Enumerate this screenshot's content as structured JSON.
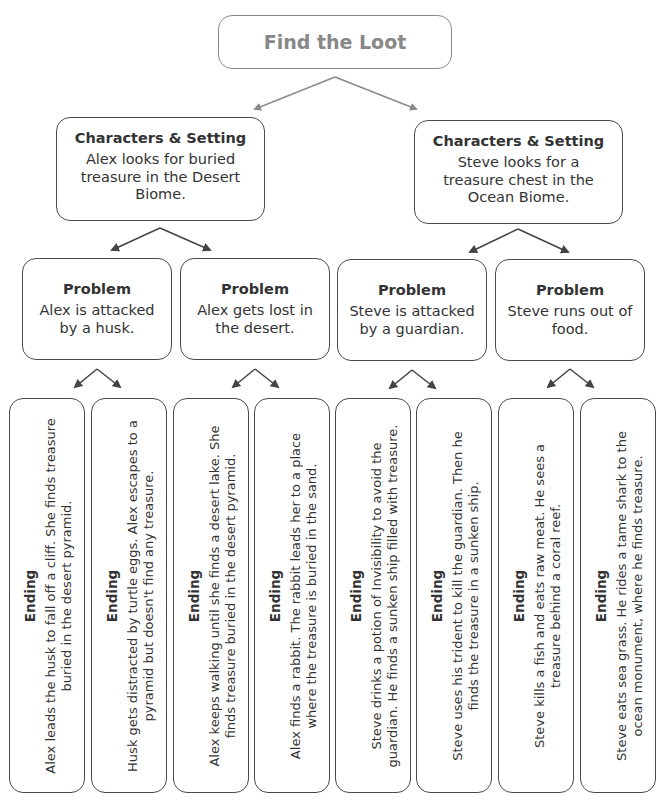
{
  "title": "Find the Loot",
  "colors": {
    "border": "#4a4a4a",
    "title_border": "#8a8a8a",
    "title_text": "#888888",
    "arrow_top": "#8a8a8a",
    "arrow": "#444444",
    "text": "#333333"
  },
  "branches": [
    {
      "setting": {
        "heading": "Characters & Setting",
        "text": "Alex looks for buried  treasure in the Desert Biome."
      },
      "problems": [
        {
          "heading": "Problem",
          "text": "Alex is attacked by a husk.",
          "endings": [
            {
              "heading": "Ending",
              "text": "Alex leads the husk to fall off a cliff. She finds treasure buried in the desert pyramid."
            },
            {
              "heading": "Ending",
              "text": "Husk gets distracted by turtle eggs. Alex escapes to a pyramid but doesn't find any treasure."
            }
          ]
        },
        {
          "heading": "Problem",
          "text": "Alex gets lost in the desert.",
          "endings": [
            {
              "heading": "Ending",
              "text": "Alex keeps walking until she finds a desert lake. She finds treasure buried in the desert pyramid."
            },
            {
              "heading": "Ending",
              "text": "Alex finds a rabbit. The rabbit leads her to a place where the treasure is buried in the sand."
            }
          ]
        }
      ]
    },
    {
      "setting": {
        "heading": "Characters & Setting",
        "text": "Steve looks for a treasure chest in the Ocean Biome."
      },
      "problems": [
        {
          "heading": "Problem",
          "text": "Steve is attacked by a guardian.",
          "endings": [
            {
              "heading": "Ending",
              "text": "Steve drinks a potion of Invisibility to avoid the guardian. He finds a sunken ship filled with treasure."
            },
            {
              "heading": "Ending",
              "text": "Steve uses his trident to kill the guardian. Then he finds the treasure in a sunken ship."
            }
          ]
        },
        {
          "heading": "Problem",
          "text": "Steve runs out of food.",
          "endings": [
            {
              "heading": "Ending",
              "text": "Steve kills a fish and eats raw meat. He sees a treasure behind a coral reef."
            },
            {
              "heading": "Ending",
              "text": "Steve eats sea grass. He rides a tame shark to the ocean monument, where he finds treasure."
            }
          ]
        }
      ]
    }
  ]
}
